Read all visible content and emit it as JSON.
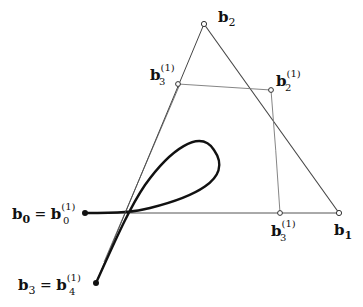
{
  "diagram": {
    "colors": {
      "ink": "#111111",
      "thin_line": "#555555",
      "curve": "#111111"
    },
    "points": {
      "b0": {
        "x": 85,
        "y": 213
      },
      "b1": {
        "x": 339,
        "y": 213
      },
      "b2": {
        "x": 204,
        "y": 24
      },
      "b3": {
        "x": 96,
        "y": 283
      },
      "b3_1_upper": {
        "x": 178,
        "y": 84
      },
      "b2_1": {
        "x": 271,
        "y": 90
      },
      "b3_1_lower": {
        "x": 280,
        "y": 213
      }
    },
    "labels": {
      "b2": {
        "base": "b",
        "sub": "2",
        "sup": ""
      },
      "b3_1_upper": {
        "base": "b",
        "sub": "3",
        "sup": "(1)"
      },
      "b2_1": {
        "base": "b",
        "sub": "2",
        "sup": "(1)"
      },
      "b0_eq": {
        "base": "b",
        "sub": "0",
        "eq": " = ",
        "base2": "b",
        "sub2": "0",
        "sup2": "(1)"
      },
      "b3_1_lower": {
        "base": "b",
        "sub": "3",
        "sup": "(1)"
      },
      "b1": {
        "base": "b",
        "sub": "1",
        "sup": ""
      },
      "b3_eq": {
        "base": "b",
        "sub": "3",
        "eq": " = ",
        "base2": "b",
        "sub2": "4",
        "sup2": "(1)"
      }
    }
  }
}
